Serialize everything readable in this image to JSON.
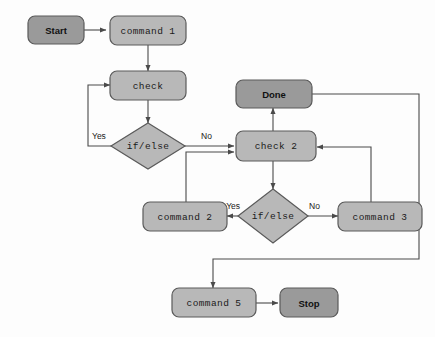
{
  "diagram": {
    "background_color": "#fdfdfd",
    "node_fill_light": "#b8b8b8",
    "node_fill_dark": "#9a9a9a",
    "node_stroke": "#5a5a5a",
    "edge_color": "#4a4a4a",
    "nodes": {
      "start": {
        "label": "Start",
        "shape": "rounded-rect",
        "style": "terminal"
      },
      "command1": {
        "label": "command 1",
        "shape": "rounded-rect",
        "style": "process"
      },
      "check": {
        "label": "check",
        "shape": "rounded-rect",
        "style": "process"
      },
      "ifelse1": {
        "label": "if/else",
        "shape": "diamond",
        "style": "decision"
      },
      "done": {
        "label": "Done",
        "shape": "rounded-rect",
        "style": "terminal"
      },
      "check2": {
        "label": "check 2",
        "shape": "rounded-rect",
        "style": "process"
      },
      "ifelse2": {
        "label": "if/else",
        "shape": "diamond",
        "style": "decision"
      },
      "command2": {
        "label": "command 2",
        "shape": "rounded-rect",
        "style": "process"
      },
      "command3": {
        "label": "command 3",
        "shape": "rounded-rect",
        "style": "process"
      },
      "command5": {
        "label": "command 5",
        "shape": "rounded-rect",
        "style": "process"
      },
      "stop": {
        "label": "Stop",
        "shape": "rounded-rect",
        "style": "terminal"
      }
    },
    "edge_labels": {
      "ifelse1_yes": "Yes",
      "ifelse1_no": "No",
      "ifelse2_yes": "Yes",
      "ifelse2_no": "No"
    },
    "edges": [
      {
        "from": "start",
        "to": "command1",
        "label": ""
      },
      {
        "from": "command1",
        "to": "check",
        "label": ""
      },
      {
        "from": "check",
        "to": "ifelse1",
        "label": ""
      },
      {
        "from": "ifelse1",
        "to": "check",
        "label": "Yes"
      },
      {
        "from": "ifelse1",
        "to": "check2",
        "label": "No"
      },
      {
        "from": "check2",
        "to": "done",
        "label": ""
      },
      {
        "from": "check2",
        "to": "ifelse2",
        "label": ""
      },
      {
        "from": "ifelse2",
        "to": "command2",
        "label": "Yes"
      },
      {
        "from": "ifelse2",
        "to": "command3",
        "label": "No"
      },
      {
        "from": "command2",
        "to": "check2",
        "label": ""
      },
      {
        "from": "command3",
        "to": "check2",
        "label": ""
      },
      {
        "from": "done",
        "to": "command5",
        "label": ""
      },
      {
        "from": "command5",
        "to": "stop",
        "label": ""
      }
    ]
  }
}
